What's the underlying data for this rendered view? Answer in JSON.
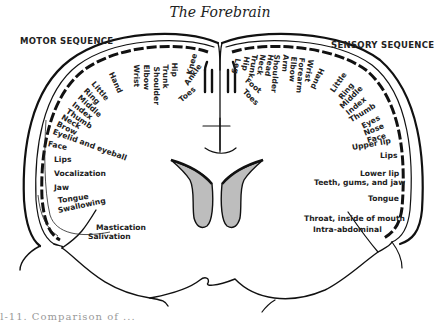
{
  "title": "The Forebrain",
  "motor": {
    "heading": "MOTOR SEQUENCE",
    "labels": [
      "Toes",
      "Ankle",
      "Knee",
      "Hip",
      "Trunk",
      "Shoulder",
      "Elbow",
      "Wrist",
      "Hand",
      "Little",
      "Ring",
      "Middle",
      "Index",
      "Thumb",
      "Neck",
      "Brow",
      "Eyelid and eyeball",
      "Face",
      "Lips",
      "Vocalization",
      "Jaw",
      "Tongue",
      "Swallowing",
      "Mastication",
      "Salivation"
    ]
  },
  "sensory": {
    "heading": "SENSORY SEQUENCE",
    "labels": [
      "Toes",
      "Foot",
      "Leg",
      "Hip",
      "Trunk",
      "Neck",
      "Head",
      "Shoulder",
      "Arm",
      "Elbow",
      "Forearm",
      "Wrist",
      "Hand",
      "Little",
      "Ring",
      "Middle",
      "Index",
      "Thumb",
      "Eyes",
      "Nose",
      "Face",
      "Upper lip",
      "Lips",
      "Lower lip",
      "Teeth, gums, and jaw",
      "Tongue",
      "Throat, inside of mouth",
      "Intra-abdominal"
    ]
  },
  "caption": "ll-11. Comparison of ..."
}
